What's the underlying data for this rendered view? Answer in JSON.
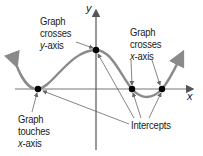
{
  "diagram": {
    "type": "function-graph-intercepts",
    "axes": {
      "x_label": "x",
      "y_label": "y"
    },
    "colors": {
      "curve": "#8a8a8a",
      "axis": "#555555",
      "point": "#000000",
      "leader": "#666666",
      "text": "#1a1a1a"
    },
    "annotations": {
      "crosses_y": {
        "line1": "Graph",
        "line2": "crosses",
        "line3_var": "y",
        "line3_rest": "-axis"
      },
      "crosses_x": {
        "line1": "Graph",
        "line2": "crosses",
        "line3_var": "x",
        "line3_rest": "-axis"
      },
      "touches_x": {
        "line1": "Graph",
        "line2": "touches",
        "line3_var": "x",
        "line3_rest": "-axis"
      },
      "intercepts": "Intercepts"
    },
    "points": [
      {
        "name": "touch-x-intercept",
        "x": 38,
        "y": 89
      },
      {
        "name": "y-intercept",
        "x": 96,
        "y": 50
      },
      {
        "name": "cross-x-intercept-1",
        "x": 132,
        "y": 89
      },
      {
        "name": "cross-x-intercept-2",
        "x": 162,
        "y": 89
      }
    ]
  }
}
